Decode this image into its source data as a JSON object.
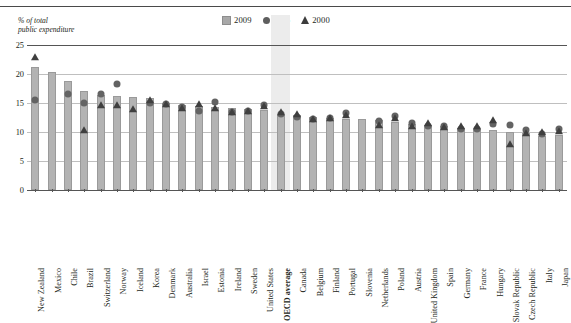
{
  "axis_caption": "% of total\npublic expenditure",
  "legend": [
    {
      "name": "legend-2009",
      "label": "2009",
      "marker": "square",
      "color": "#a8a8a8"
    },
    {
      "name": "legend-2005",
      "label": "2005",
      "marker": "circle",
      "color": "#5e5e5e"
    },
    {
      "name": "legend-2000",
      "label": "2000",
      "marker": "triangle",
      "color": "#3c3c3c"
    }
  ],
  "highlight_category": "OECD average",
  "chart_data": {
    "type": "bar",
    "title": "",
    "subtitle": "",
    "xlabel": "",
    "ylabel": "% of total public expenditure",
    "ylim": [
      0,
      25
    ],
    "yticks": [
      0,
      5,
      10,
      15,
      20,
      25
    ],
    "grid": true,
    "legend_position": "top-right",
    "categories": [
      "New Zealand",
      "Mexico",
      "Chile",
      "Brazil",
      "Switzerland",
      "Norway",
      "Iceland",
      "Korea",
      "Denmark",
      "Australia",
      "Israel",
      "Estonia",
      "Ireland",
      "Sweden",
      "United States",
      "OECD average",
      "Canada",
      "Belgium",
      "Finland",
      "Portugal",
      "Slovenia",
      "Netherlands",
      "Poland",
      "Austria",
      "United Kingdom",
      "Spain",
      "Germany",
      "France",
      "Hungary",
      "Slovak Republic",
      "Czech Republic",
      "Italy",
      "Japan"
    ],
    "series": [
      {
        "name": "2009",
        "marker": "bar",
        "values": [
          21.2,
          20.4,
          18.8,
          17.1,
          16.4,
          16.2,
          16.1,
          15.8,
          15.0,
          14.6,
          14.4,
          14.3,
          14.2,
          14.0,
          13.8,
          13.0,
          13.0,
          12.6,
          12.4,
          12.3,
          12.2,
          12.0,
          11.8,
          11.3,
          11.2,
          11.1,
          10.7,
          10.6,
          10.4,
          10.0,
          9.9,
          9.3,
          9.4
        ]
      },
      {
        "name": "2005",
        "marker": "circle",
        "values": [
          15.6,
          null,
          16.6,
          15.0,
          16.5,
          18.3,
          null,
          15.0,
          14.8,
          14.3,
          13.6,
          15.2,
          13.4,
          13.6,
          14.7,
          13.1,
          12.6,
          12.2,
          12.5,
          13.2,
          null,
          11.9,
          12.8,
          11.5,
          11.0,
          11.1,
          10.5,
          10.5,
          11.3,
          11.2,
          10.3,
          9.7,
          10.6
        ]
      },
      {
        "name": "2000",
        "marker": "triangle",
        "values": [
          23.0,
          null,
          null,
          10.4,
          14.7,
          14.6,
          14.0,
          15.6,
          14.8,
          14.2,
          14.9,
          14.1,
          13.5,
          13.7,
          14.4,
          13.5,
          13.1,
          12.2,
          12.5,
          13.0,
          null,
          11.2,
          12.4,
          11.1,
          11.6,
          10.8,
          11.0,
          11.0,
          12.0,
          8.0,
          9.9,
          10.0,
          10.1
        ]
      }
    ]
  }
}
